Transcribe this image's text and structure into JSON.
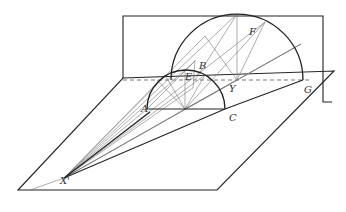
{
  "diagram": {
    "labels": {
      "A": "A",
      "B": "B",
      "E": "E",
      "F": "F",
      "Y": "Y",
      "C": "C",
      "G": "G",
      "X": "X'"
    },
    "colors": {
      "stroke_bold": "#222222",
      "stroke_thin": "#777777",
      "background": "#ffffff"
    }
  }
}
